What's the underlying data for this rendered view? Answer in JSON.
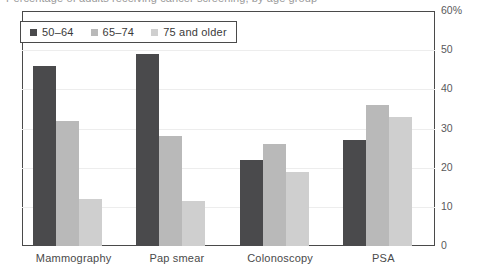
{
  "title": "Percentage of adults receiving cancer screening, by age group",
  "legend": {
    "position": "top-left-inside",
    "items": [
      {
        "label": "50–64",
        "color": "#4a4a4c"
      },
      {
        "label": "65–74",
        "color": "#b9b9b9"
      },
      {
        "label": "75 and older",
        "color": "#cfcfcf"
      }
    ]
  },
  "axis": {
    "y_ticks": [
      "60%",
      "50",
      "40",
      "30",
      "20",
      "10",
      "0"
    ],
    "y_values": [
      60,
      50,
      40,
      30,
      20,
      10,
      0
    ]
  },
  "chart_data": {
    "type": "bar",
    "title": "",
    "xlabel": "",
    "ylabel": "",
    "ylim": [
      0,
      60
    ],
    "grid": true,
    "legend_position": "top-left-inside",
    "categories": [
      "Mammography",
      "Pap smear",
      "Colonoscopy",
      "PSA"
    ],
    "series": [
      {
        "name": "50–64",
        "color": "#4a4a4c",
        "values": [
          46,
          49,
          22,
          27
        ]
      },
      {
        "name": "65–74",
        "color": "#b9b9b9",
        "values": [
          32,
          28,
          26,
          36
        ]
      },
      {
        "name": "75 and older",
        "color": "#cfcfcf",
        "values": [
          12,
          11.5,
          19,
          33
        ]
      }
    ]
  }
}
